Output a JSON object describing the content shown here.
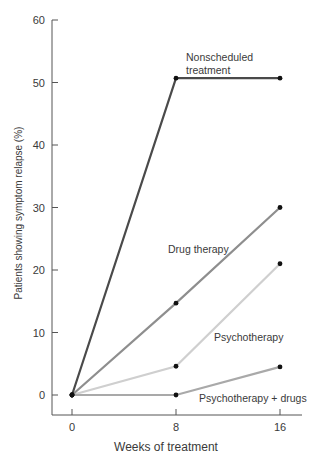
{
  "chart_data": {
    "type": "line",
    "title": "",
    "xlabel": "Weeks of treatment",
    "ylabel": "Patients showing symptom relapse (%)",
    "x": [
      0,
      8,
      16
    ],
    "x_ticks": [
      "0",
      "8",
      "16"
    ],
    "y_ticks": [
      "0",
      "10",
      "20",
      "30",
      "40",
      "50",
      "60"
    ],
    "ylim": [
      0,
      60
    ],
    "grid": false,
    "legend": "inline labels",
    "series": [
      {
        "name": "Nonscheduled treatment",
        "label_lines": [
          "Nonscheduled",
          "treatment"
        ],
        "values": [
          0,
          50.7,
          50.7
        ],
        "color": "#4a4a4a"
      },
      {
        "name": "Drug therapy",
        "label_lines": [
          "Drug therapy"
        ],
        "values": [
          0,
          14.7,
          30
        ],
        "color": "#8e8e8e"
      },
      {
        "name": "Psychotherapy",
        "label_lines": [
          "Psychotherapy"
        ],
        "values": [
          0,
          4.6,
          21
        ],
        "color": "#cfcfcf"
      },
      {
        "name": "Psychotherapy + drugs",
        "label_lines": [
          "Psychotherapy + drugs"
        ],
        "values": [
          0,
          0,
          4.5
        ],
        "color": "#a9a9a9"
      }
    ]
  }
}
